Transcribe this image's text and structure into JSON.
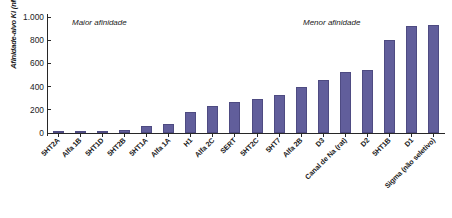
{
  "chart_data": {
    "type": "bar",
    "title": "",
    "xlabel": "",
    "ylabel": "Afinidade-alvo Ki (nM)",
    "ylim": [
      0,
      1000
    ],
    "yticks": [
      "0",
      "200",
      "400",
      "600",
      "800",
      "1.000"
    ],
    "ytick_values": [
      0,
      200,
      400,
      600,
      800,
      1000
    ],
    "grid": false,
    "legend": "none",
    "bar_color": "#615e9b",
    "categories": [
      "5HT2A",
      "Alfa 1B",
      "5HT1D",
      "5HT2B",
      "5HT1A",
      "Alfa 1A",
      "H1",
      "Alfa 2C",
      "SERT",
      "5HT2C",
      "5HT7",
      "Alfa 2B",
      "D3",
      "Canal de Na (rat)",
      "D2",
      "5HT1B",
      "D1",
      "Sigma (não seletivo)"
    ],
    "values": [
      3,
      5,
      10,
      30,
      60,
      80,
      180,
      230,
      270,
      290,
      330,
      400,
      460,
      530,
      540,
      800,
      920,
      930
    ],
    "annotations": [
      {
        "text": "Maior afinidade",
        "position": "top-left"
      },
      {
        "text": "Menor afinidade",
        "position": "top-right"
      }
    ]
  },
  "annotation_left": "Maior afinidade",
  "annotation_right": "Menor afinidade"
}
